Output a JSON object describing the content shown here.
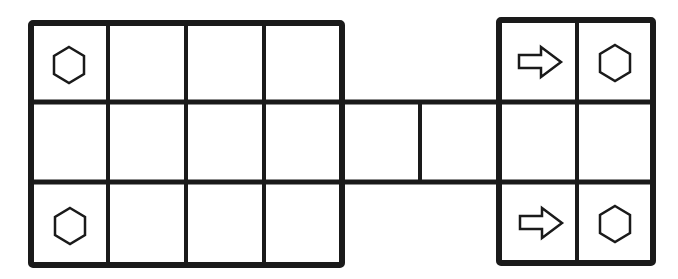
{
  "diagram": {
    "line_color": "#1a1a1a",
    "background": "#ffffff",
    "left_block": {
      "cols": 4,
      "rows": 3,
      "icons": [
        {
          "row": 0,
          "col": 0,
          "type": "hexagon-icon"
        },
        {
          "row": 2,
          "col": 0,
          "type": "hexagon-icon"
        }
      ]
    },
    "connector": {
      "cells": 2
    },
    "right_block": {
      "cols": 2,
      "rows": 3,
      "icons": [
        {
          "row": 0,
          "col": 0,
          "type": "arrow-right-icon"
        },
        {
          "row": 0,
          "col": 1,
          "type": "hexagon-icon"
        },
        {
          "row": 2,
          "col": 0,
          "type": "arrow-right-icon"
        },
        {
          "row": 2,
          "col": 1,
          "type": "hexagon-icon"
        }
      ]
    }
  }
}
